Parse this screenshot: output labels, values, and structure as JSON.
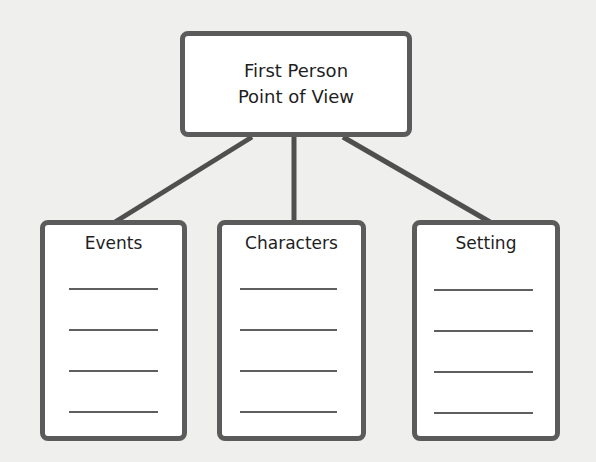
{
  "diagram": {
    "type": "tree",
    "root": {
      "line1": "First Person",
      "line2": "Point of View"
    },
    "children": [
      {
        "title": "Events",
        "blank_lines": 4
      },
      {
        "title": "Characters",
        "blank_lines": 4
      },
      {
        "title": "Setting",
        "blank_lines": 4
      }
    ],
    "colors": {
      "background": "#efefed",
      "border": "#5b5b5b",
      "box_fill": "#ffffff",
      "text": "#1e1e1e"
    }
  }
}
